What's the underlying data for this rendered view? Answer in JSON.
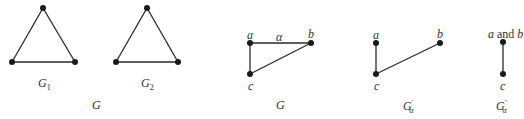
{
  "figure": {
    "panel_left": {
      "caption": "G",
      "graphs": [
        {
          "name": "G",
          "subscript": "1",
          "vertices": 3,
          "edges": 3,
          "shape": "triangle"
        },
        {
          "name": "G",
          "subscript": "2",
          "vertices": 3,
          "edges": 3,
          "shape": "triangle"
        }
      ]
    },
    "panel_right": {
      "graphs": [
        {
          "caption": "G",
          "vertices": [
            "a",
            "b",
            "c"
          ],
          "edges": [
            [
              "a",
              "b",
              "α"
            ],
            [
              "a",
              "c",
              ""
            ],
            [
              "c",
              "b",
              ""
            ]
          ],
          "edge_label": "α"
        },
        {
          "caption": "G",
          "caption_subscript": "α",
          "caption_prime": "′",
          "vertices": [
            "a",
            "b",
            "c"
          ],
          "edges": [
            [
              "a",
              "c",
              ""
            ],
            [
              "c",
              "b",
              ""
            ]
          ]
        },
        {
          "caption": "G",
          "caption_subscript": "α",
          "caption_prime": "″",
          "vertices": [
            "a and b",
            "c"
          ],
          "vertex_top_a": "a",
          "vertex_top_and": " and ",
          "vertex_top_b": "b",
          "vertex_bottom": "c",
          "edges": [
            [
              "a and b",
              "c",
              ""
            ]
          ]
        }
      ]
    },
    "colors": {
      "stroke": "#2a2a2a",
      "vertex": "#1a1a1a",
      "text": "#333333"
    }
  }
}
